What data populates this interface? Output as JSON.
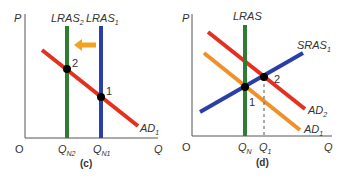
{
  "colors": {
    "lras2": "#2e7d32",
    "lras1": "#2a3ea8",
    "ad1_c": "#e53020",
    "arrow": "#f2a31f",
    "lras_d": "#2e7d32",
    "sras": "#2a3ea8",
    "ad2": "#e53020",
    "ad1_d": "#f0902a",
    "axis": "#555555",
    "point": "#000000"
  },
  "panels": [
    {
      "caption": "(c)",
      "y_label": "P",
      "x_label": "Q",
      "origin": "O",
      "curves": {
        "lras2": {
          "main": "LRAS",
          "sub": "2"
        },
        "lras1": {
          "main": "LRAS",
          "sub": "1"
        },
        "ad1": {
          "main": "AD",
          "sub": "1"
        }
      },
      "x_ticks": [
        {
          "main": "Q",
          "sub": "N2"
        },
        {
          "main": "Q",
          "sub": "N1"
        }
      ],
      "points": [
        "2",
        "1"
      ]
    },
    {
      "caption": "(d)",
      "y_label": "P",
      "x_label": "Q",
      "origin": "O",
      "curves": {
        "lras": {
          "main": "LRAS"
        },
        "sras1": {
          "main": "SRAS",
          "sub": "1"
        },
        "ad2": {
          "main": "AD",
          "sub": "2"
        },
        "ad1": {
          "main": "AD",
          "sub": "1"
        }
      },
      "x_ticks": [
        {
          "main": "Q",
          "sub": "N"
        },
        {
          "main": "Q",
          "sub": "1"
        }
      ],
      "points": [
        "2",
        "1"
      ]
    }
  ]
}
